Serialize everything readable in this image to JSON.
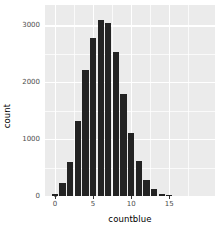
{
  "chart_data": {
    "type": "bar",
    "title": "",
    "subtitle": "",
    "xlabel": "countblue",
    "ylabel": "count",
    "categories": [
      0,
      1,
      2,
      3,
      4,
      5,
      6,
      7,
      8,
      9,
      10,
      11,
      12,
      13,
      14,
      15
    ],
    "values": [
      30,
      230,
      600,
      1320,
      2220,
      2780,
      3100,
      3040,
      2530,
      1790,
      1100,
      620,
      290,
      130,
      30,
      10
    ],
    "x": [
      0,
      1,
      2,
      3,
      4,
      5,
      6,
      7,
      8,
      9,
      10,
      11,
      12,
      13,
      14,
      15
    ],
    "series": [
      {
        "name": "count",
        "values": [
          30,
          230,
          600,
          1320,
          2220,
          2780,
          3100,
          3040,
          2530,
          1790,
          1100,
          620,
          290,
          130,
          30,
          10
        ]
      }
    ],
    "xlim": [
      -1.3,
      21.0
    ],
    "ylim": [
      0,
      3360
    ],
    "xticks": [
      0,
      5,
      10,
      15
    ],
    "xtick_labels": [
      "0",
      "5",
      "10",
      "15"
    ],
    "yticks": [
      0,
      1000,
      2000,
      3000
    ],
    "ytick_labels": [
      "0",
      "1000",
      "2000",
      "3000"
    ],
    "x_minor_ticks": [
      2.5,
      7.5,
      12.5,
      17.5
    ],
    "y_minor_ticks": [
      500,
      1500,
      2500
    ],
    "grid": true,
    "legend": false,
    "legend_position": "none",
    "binwidth": 1,
    "bar_width": 0.82,
    "annotations": [],
    "colors": {
      "bar_fill": "#232323",
      "panel_background": "#ebebeb",
      "grid_line": "#ffffff",
      "plot_background": "#ffffff",
      "axis_text": "#4d4d4d",
      "axis_title": "#000000",
      "tick_mark": "#333333"
    }
  }
}
